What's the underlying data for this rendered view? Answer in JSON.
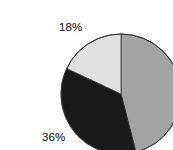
{
  "chart_data": {
    "type": "pie",
    "title": "",
    "subtitle": "",
    "xlabel": "",
    "ylabel": "",
    "legend": "none",
    "grid": false,
    "data_labels_shown": true,
    "label_format": "percent",
    "start_angle_deg": 0,
    "direction": "clockwise",
    "categories": [
      "Segment 1",
      "Segment 2",
      "Segment 3"
    ],
    "values": [
      46,
      36,
      18
    ],
    "slices": [
      {
        "label": "46%",
        "value": 46,
        "color": "#a3a3a3",
        "start_angle_deg": 0,
        "end_angle_deg": 165.6,
        "label_position": "right"
      },
      {
        "label": "36%",
        "value": 36,
        "color": "#1a1a1a",
        "start_angle_deg": 165.6,
        "end_angle_deg": 295.2,
        "label_position": "bottom-left"
      },
      {
        "label": "18%",
        "value": 18,
        "color": "#e0e0e0",
        "start_angle_deg": 295.2,
        "end_angle_deg": 360,
        "label_position": "top-left"
      }
    ],
    "geometry": {
      "center_x": 81,
      "center_y": 78,
      "radius": 60,
      "outline_color": "#333333",
      "outline_width": 1
    },
    "background_color": "#ffffff",
    "label_text_color": "#2c2c2c"
  }
}
